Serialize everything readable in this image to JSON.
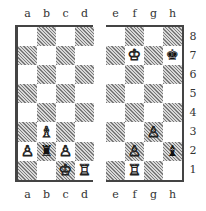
{
  "diagram": {
    "type": "chess_position_split_board",
    "files_left": [
      "a",
      "b",
      "c",
      "d"
    ],
    "files_right": [
      "e",
      "f",
      "g",
      "h"
    ],
    "ranks": [
      "8",
      "7",
      "6",
      "5",
      "4",
      "3",
      "2",
      "1"
    ],
    "pieces": [
      {
        "square": "a2",
        "color": "white",
        "piece": "pawn",
        "glyph": "♙"
      },
      {
        "square": "b3",
        "color": "white",
        "piece": "bishop",
        "glyph": "♗"
      },
      {
        "square": "b2",
        "color": "black",
        "piece": "rook",
        "glyph": "♜"
      },
      {
        "square": "c2",
        "color": "white",
        "piece": "pawn",
        "glyph": "♙"
      },
      {
        "square": "c1",
        "color": "white",
        "piece": "king",
        "glyph": "♔"
      },
      {
        "square": "d1",
        "color": "white",
        "piece": "rook",
        "glyph": "♖"
      },
      {
        "square": "f7",
        "color": "white",
        "piece": "king",
        "glyph": "♔"
      },
      {
        "square": "h7",
        "color": "black",
        "piece": "king",
        "glyph": "♚"
      },
      {
        "square": "g3",
        "color": "white",
        "piece": "pawn",
        "glyph": "♙"
      },
      {
        "square": "f2",
        "color": "white",
        "piece": "pawn",
        "glyph": "♙"
      },
      {
        "square": "h2",
        "color": "black",
        "piece": "bishop",
        "glyph": "♝"
      },
      {
        "square": "f1",
        "color": "white",
        "piece": "rook",
        "glyph": "♖"
      }
    ],
    "colors": {
      "dark_square": "#9a9a9a",
      "light_square": "#ffffff",
      "border": "#444444"
    }
  }
}
